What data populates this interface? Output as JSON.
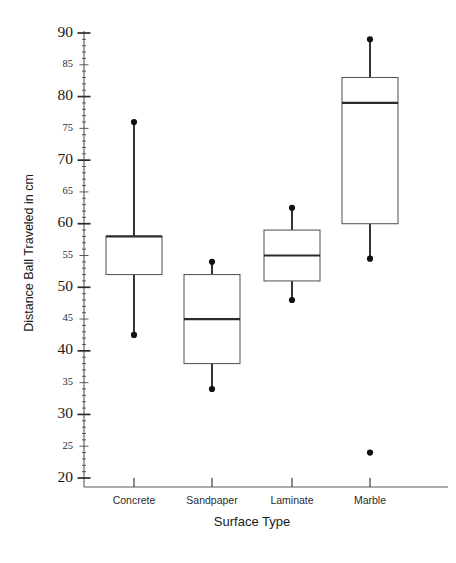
{
  "chart_data": {
    "type": "box",
    "title": "",
    "xlabel": "Surface Type",
    "ylabel": "Distance Ball Traveled in cm",
    "categories": [
      "Concrete",
      "Sandpaper",
      "Laminate",
      "Marble"
    ],
    "ylim": [
      18,
      90
    ],
    "y_major_ticks": [
      20,
      30,
      40,
      50,
      60,
      70,
      80,
      90
    ],
    "y_minor_ticks": [
      25,
      35,
      45,
      55,
      65,
      75,
      85
    ],
    "y_tick_step_major": 10,
    "y_tick_step_minor": 5,
    "grid": false,
    "legend": false,
    "legend_position": "none",
    "boxes": [
      {
        "category": "Concrete",
        "min": 42.5,
        "q1": 52,
        "median": 58,
        "q3": 58,
        "max": 76,
        "outliers": []
      },
      {
        "category": "Sandpaper",
        "min": 34,
        "q1": 38,
        "median": 45,
        "q3": 52,
        "max": 54,
        "outliers": []
      },
      {
        "category": "Laminate",
        "min": 48,
        "q1": 51,
        "median": 55,
        "q3": 59,
        "max": 62.5,
        "outliers": []
      },
      {
        "category": "Marble",
        "min": 54.5,
        "q1": 60,
        "median": 79,
        "q3": 83,
        "max": 89,
        "outliers": [
          24
        ]
      }
    ],
    "colors": {
      "background": "#ffffff",
      "box_fill": "#ffffff",
      "box_stroke": "#555555",
      "median": "#2b2b2b",
      "whisker": "#2b2b2b",
      "point": "#111111",
      "axis": "#5a5a5a",
      "text": "#1a1a1a"
    }
  },
  "axis": {
    "y_title": "Distance Ball Traveled in cm",
    "x_title": "Surface Type",
    "y_major_labels": [
      "90",
      "80",
      "70",
      "60",
      "50",
      "40",
      "30",
      "20"
    ],
    "y_minor_labels": [
      "85",
      "75",
      "65",
      "55",
      "45",
      "35",
      "25"
    ]
  }
}
